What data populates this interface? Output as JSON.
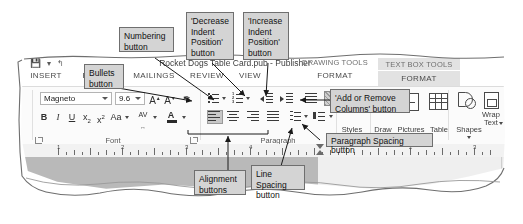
{
  "window": {
    "title": "Rocket Dogs Table Card.pub - Publisher",
    "quick_access": "▾   ↰",
    "contextual_tabs": [
      {
        "name": "drawing-tools",
        "group_label": "DRAWING TOOLS",
        "tab_label": "FORMAT",
        "active": false
      },
      {
        "name": "text-box-tools",
        "group_label": "TEXT BOX TOOLS",
        "tab_label": "FORMAT",
        "active": true
      }
    ]
  },
  "ribbon": {
    "tabs": [
      {
        "name": "insert",
        "label": "INSERT"
      },
      {
        "name": "page-design",
        "label": "PAGE"
      },
      {
        "name": "mailings",
        "label": "MAILINGS"
      },
      {
        "name": "review",
        "label": "REVIEW"
      },
      {
        "name": "view",
        "label": "VIEW"
      }
    ],
    "groups": [
      {
        "name": "font",
        "label": "Font"
      },
      {
        "name": "paragraph",
        "label": "Paragraph"
      },
      {
        "name": "styles",
        "label": "Styles"
      }
    ],
    "font_group": {
      "font_name": "Magneto",
      "font_size": "9.6",
      "grow_font": "A",
      "shrink_font": "A",
      "clear_formatting": "clear-formatting-icon",
      "bold": "B",
      "italic": "I",
      "underline": "U",
      "subscript": "x",
      "subscript_sup": "2",
      "superscript": "x",
      "superscript_sup": "2",
      "change_case": "Aa",
      "character_spacing": "AV",
      "font_color": "A"
    },
    "paragraph_group": {
      "bullets": "bullets-icon",
      "numbering": "numbering-icon",
      "decrease_indent": "decrease-indent-icon",
      "increase_indent": "increase-indent-icon",
      "columns": "add-remove-columns-icon",
      "text_direction": "text-direction-icon",
      "align_left": "align-left-icon",
      "align_center": "align-center-icon",
      "align_right": "align-right-icon",
      "align_justify": "align-justify-icon",
      "line_spacing": "line-spacing-icon",
      "paragraph_spacing": "paragraph-spacing-icon"
    },
    "right_groups": [
      {
        "name": "styles",
        "label": "Styles"
      },
      {
        "name": "draw",
        "label": "Draw"
      },
      {
        "name": "pictures",
        "label": "Pictures"
      },
      {
        "name": "table",
        "label": "Table"
      },
      {
        "name": "shapes",
        "label": "Shapes"
      },
      {
        "name": "wrap-text",
        "label": "Wrap\nText"
      }
    ]
  },
  "ruler": {
    "numbers": [
      "1",
      "2",
      "3",
      "4"
    ]
  },
  "callouts": [
    {
      "name": "numbering-button-callout",
      "text": "Numbering\nbutton"
    },
    {
      "name": "decrease-indent-position-button-callout",
      "text": "'Decrease\nIndent\nPosition'\nbutton"
    },
    {
      "name": "increase-indent-position-button-callout",
      "text": "'Increase\nIndent\nPosition'\nbutton"
    },
    {
      "name": "bullets-button-callout",
      "text": "Bullets\nbutton"
    },
    {
      "name": "add-or-remove-columns-button-callout",
      "text": "'Add or Remove\nColumns' button"
    },
    {
      "name": "paragraph-spacing-button-callout",
      "text": "Paragraph Spacing button"
    },
    {
      "name": "alignment-buttons-callout",
      "text": "Alignment\nbuttons"
    },
    {
      "name": "line-spacing-button-callout",
      "text": "Line Spacing\nbutton"
    }
  ],
  "colors": {
    "callout_fill": "#d4d4d4",
    "callout_border": "#6f6f6f",
    "active_tab": "#e2e2e2",
    "canvas": "#b9b9b9"
  }
}
